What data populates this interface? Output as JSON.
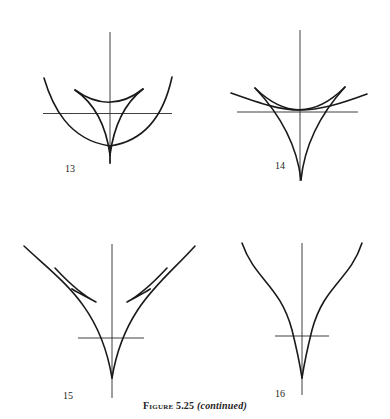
{
  "figure": {
    "caption_label": "Figure 5.25",
    "caption_note": "(continued)",
    "ink_color": "#1a1a1a",
    "background": "#ffffff"
  },
  "panels": [
    {
      "label": "13",
      "description": "Deltoid with parabola passing below; three cusps, one pointing down onto axis",
      "axes": {
        "vertical": [
          110,
          32,
          110,
          163
        ],
        "horizontal": [
          43,
          113,
          172,
          113
        ]
      }
    },
    {
      "label": "14",
      "description": "Deltoid with tangent curve touching at top arc; long cusp downward",
      "axes": {
        "vertical": [
          300,
          30,
          300,
          180
        ],
        "horizontal": [
          237,
          112,
          358,
          112
        ]
      }
    },
    {
      "label": "15",
      "description": "Two outer branches meeting at lower cusp with small swallowtail loops on each side",
      "axes": {
        "vertical": [
          112,
          244,
          112,
          398
        ],
        "horizontal": [
          78,
          338,
          144,
          338
        ]
      }
    },
    {
      "label": "16",
      "description": "Two smooth branches converging to a single cusp on the vertical axis",
      "axes": {
        "vertical": [
          302,
          243,
          302,
          395
        ],
        "horizontal": [
          275,
          336,
          329,
          336
        ]
      }
    }
  ]
}
